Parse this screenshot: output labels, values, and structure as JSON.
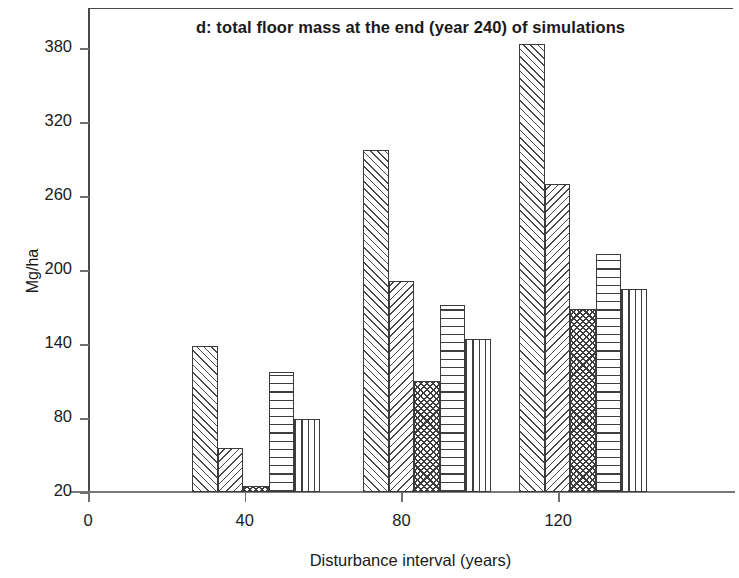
{
  "chart_data": {
    "type": "bar",
    "title": "d: total floor mass at the end (year 240) of simulations",
    "xlabel": "Disturbance interval (years)",
    "ylabel": "Mg/ha",
    "grid": false,
    "legend": "none",
    "categories": [
      "40",
      "80",
      "120"
    ],
    "xlim": [
      0,
      150
    ],
    "ylim": [
      20,
      395
    ],
    "xticks": [
      "0",
      "40",
      "80",
      "120"
    ],
    "yticks": [
      "20",
      "80",
      "140",
      "200",
      "260",
      "320",
      "380"
    ],
    "series": [
      {
        "name": "series-1",
        "pattern": "diagonal-forward",
        "values": [
          138,
          297,
          383
        ]
      },
      {
        "name": "series-2",
        "pattern": "diagonal-backward",
        "values": [
          56,
          191,
          270
        ]
      },
      {
        "name": "series-3",
        "pattern": "crosshatch",
        "values": [
          25,
          110,
          168
        ]
      },
      {
        "name": "series-4",
        "pattern": "horizontal-lines",
        "values": [
          117,
          172,
          213
        ]
      },
      {
        "name": "series-5",
        "pattern": "vertical-lines",
        "values": [
          79,
          144,
          185
        ]
      }
    ]
  },
  "axes": {
    "y_ticks": [
      {
        "label": "380",
        "value": 380
      },
      {
        "label": "320",
        "value": 320
      },
      {
        "label": "260",
        "value": 260
      },
      {
        "label": "200",
        "value": 200
      },
      {
        "label": "140",
        "value": 140
      },
      {
        "label": "80",
        "value": 80
      },
      {
        "label": "20",
        "value": 20
      }
    ],
    "x_ticks": [
      {
        "label": "0",
        "value": 0
      },
      {
        "label": "40",
        "value": 40
      },
      {
        "label": "80",
        "value": 80
      },
      {
        "label": "120",
        "value": 120
      }
    ]
  }
}
